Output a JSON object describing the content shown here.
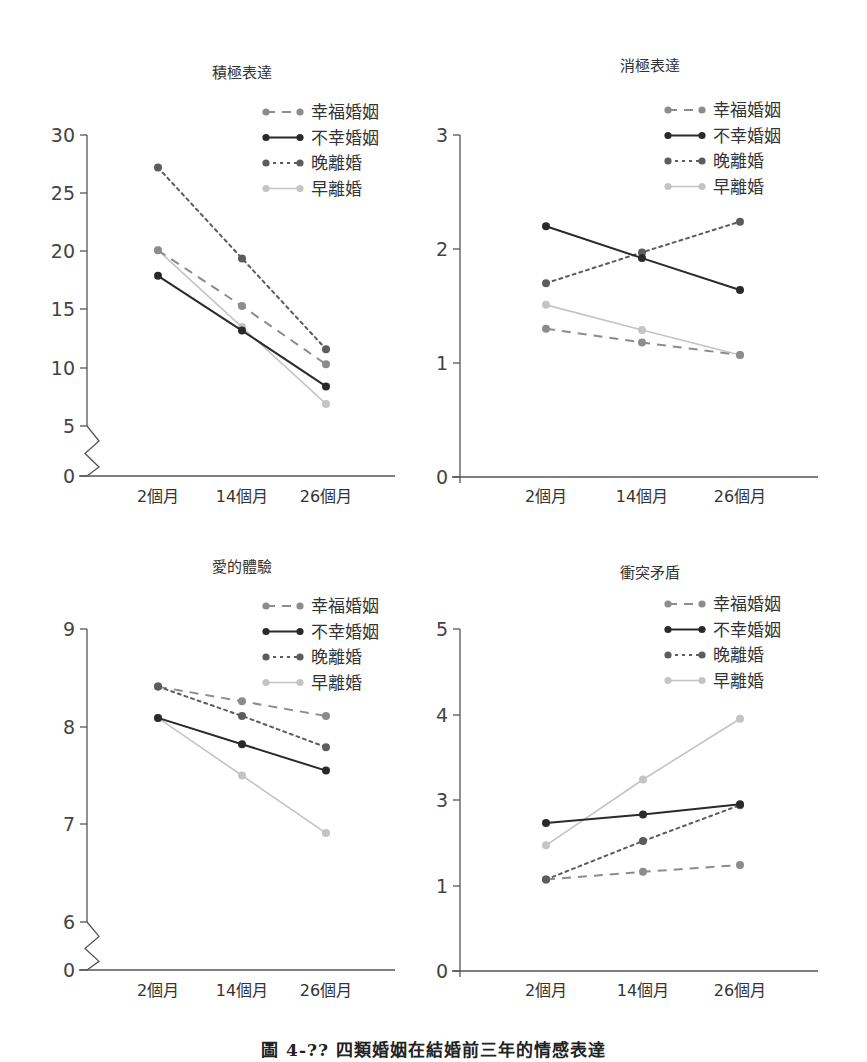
{
  "figure": {
    "caption": "圖 4-?? 四類婚姻在結婚前三年的情感表達"
  },
  "legend": [
    {
      "key": "happy",
      "label": "幸福婚姻",
      "color": "#8c8c8c",
      "dash": "9,7",
      "style": "dashed"
    },
    {
      "key": "unhappy",
      "label": "不幸婚姻",
      "color": "#2a2a2a",
      "dash": "",
      "style": "solid"
    },
    {
      "key": "late_divorce",
      "label": "晚離婚",
      "color": "#5c5c5c",
      "dash": "3,4",
      "style": "dotted"
    },
    {
      "key": "early_divorce",
      "label": "早離婚",
      "color": "#c4c4c4",
      "dash": "",
      "style": "solid-light"
    }
  ],
  "chart_data": [
    {
      "type": "line",
      "title": "積極表達",
      "xlabel": "",
      "ylabel": "",
      "categories": [
        "2個月",
        "14個月",
        "26個月"
      ],
      "ytick_labels": [
        "0",
        "5",
        "10",
        "15",
        "20",
        "25",
        "30"
      ],
      "axis_break": true,
      "ylim": [
        5,
        30
      ],
      "legend_position": "upper right",
      "grid": false,
      "series": [
        {
          "name": "幸福婚姻",
          "values": [
            20.1,
            15.3,
            10.3
          ]
        },
        {
          "name": "不幸婚姻",
          "values": [
            17.9,
            13.2,
            8.4
          ]
        },
        {
          "name": "晚離婚",
          "values": [
            27.2,
            19.4,
            11.6
          ]
        },
        {
          "name": "早離婚",
          "values": [
            20.1,
            13.5,
            6.9
          ]
        }
      ]
    },
    {
      "type": "line",
      "title": "消極表達",
      "xlabel": "",
      "ylabel": "",
      "categories": [
        "2個月",
        "14個月",
        "26個月"
      ],
      "ytick_labels": [
        "0",
        "1",
        "2",
        "3"
      ],
      "axis_break": false,
      "ylim": [
        0,
        3
      ],
      "legend_position": "upper right",
      "grid": false,
      "series": [
        {
          "name": "幸福婚姻",
          "values": [
            1.3,
            1.18,
            1.07
          ]
        },
        {
          "name": "不幸婚姻",
          "values": [
            2.2,
            1.92,
            1.64
          ]
        },
        {
          "name": "晚離婚",
          "values": [
            1.7,
            1.97,
            2.24
          ]
        },
        {
          "name": "早離婚",
          "values": [
            1.51,
            1.29,
            1.07
          ]
        }
      ]
    },
    {
      "type": "line",
      "title": "愛的體驗",
      "xlabel": "",
      "ylabel": "",
      "categories": [
        "2個月",
        "14個月",
        "26個月"
      ],
      "ytick_labels": [
        "0",
        "6",
        "7",
        "8",
        "9"
      ],
      "axis_break": true,
      "ylim": [
        6,
        9
      ],
      "legend_position": "upper right",
      "grid": false,
      "series": [
        {
          "name": "幸福婚姻",
          "values": [
            8.41,
            8.26,
            8.11
          ]
        },
        {
          "name": "不幸婚姻",
          "values": [
            8.09,
            7.82,
            7.55
          ]
        },
        {
          "name": "晚離婚",
          "values": [
            8.41,
            8.11,
            7.79
          ]
        },
        {
          "name": "早離婚",
          "values": [
            8.09,
            7.5,
            6.91
          ]
        }
      ]
    },
    {
      "type": "line",
      "title": "衝突矛盾",
      "xlabel": "",
      "ylabel": "",
      "categories": [
        "2個月",
        "14個月",
        "26個月"
      ],
      "ytick_labels": [
        "0",
        "1",
        "3",
        "4",
        "5"
      ],
      "axis_break": false,
      "ylim": [
        0,
        4
      ],
      "note": "values expressed in tick-index units (ticks evenly spaced, labelled 0,1,3,4,5)",
      "legend_position": "upper right",
      "grid": false,
      "series": [
        {
          "name": "幸福婚姻",
          "values": [
            1.07,
            1.16,
            1.24
          ]
        },
        {
          "name": "不幸婚姻",
          "values": [
            1.73,
            1.83,
            1.95
          ]
        },
        {
          "name": "晚離婚",
          "values": [
            1.07,
            1.52,
            1.94
          ]
        },
        {
          "name": "早離婚",
          "values": [
            1.47,
            2.24,
            2.95
          ]
        }
      ]
    }
  ],
  "layout": [
    {
      "axis_x": 87,
      "x_end": 395,
      "y_top": 135,
      "y_zero": 476,
      "title_x": 242,
      "title_y": 78,
      "point_x": [
        158,
        242,
        326
      ],
      "tick_y": [
        476,
        426,
        368,
        309,
        251,
        193,
        135
      ],
      "val_ref": [
        5,
        426,
        30,
        135
      ],
      "legend_x": 266,
      "legend_y": 112,
      "xlabel_y": 502
    },
    {
      "axis_x": 460,
      "x_end": 818,
      "y_top": 135,
      "y_zero": 477,
      "title_x": 650,
      "title_y": 71,
      "point_x": [
        546,
        642,
        740
      ],
      "tick_y": [
        477,
        363,
        249,
        135
      ],
      "val_ref": [
        0,
        477,
        3,
        135
      ],
      "legend_x": 668,
      "legend_y": 110,
      "xlabel_y": 502
    },
    {
      "axis_x": 87,
      "x_end": 395,
      "y_top": 629,
      "y_zero": 970,
      "title_x": 242,
      "title_y": 572,
      "point_x": [
        158,
        242,
        326
      ],
      "tick_y": [
        970,
        922,
        824,
        727,
        629
      ],
      "val_ref": [
        6,
        922,
        9,
        629
      ],
      "legend_x": 266,
      "legend_y": 606,
      "xlabel_y": 996
    },
    {
      "axis_x": 460,
      "x_end": 818,
      "y_top": 629,
      "y_zero": 971,
      "title_x": 650,
      "title_y": 578,
      "point_x": [
        546,
        643,
        740
      ],
      "tick_y": [
        971,
        886,
        800,
        715,
        629
      ],
      "val_ref": [
        0,
        971,
        4,
        629
      ],
      "legend_x": 668,
      "legend_y": 604,
      "xlabel_y": 996
    }
  ]
}
